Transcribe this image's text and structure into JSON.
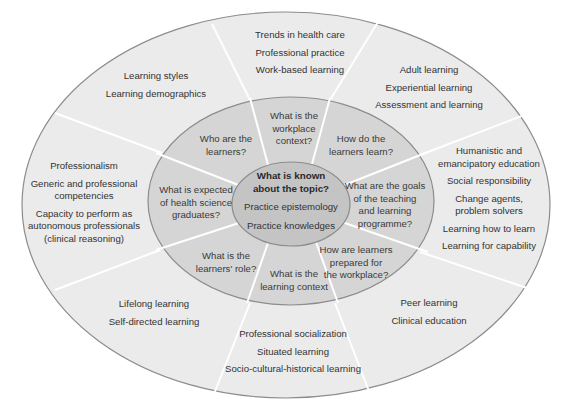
{
  "colors": {
    "outer_ring": "#ebebeb",
    "middle_ring": "#d5d5d5",
    "center": "#c4c4c4",
    "outline": "#8c8c8c",
    "divider": "#ffffff"
  },
  "center": {
    "title_line1": "What is known",
    "title_line2": "about the topic?",
    "items": [
      "Practice epistemology",
      "Practice knowledges"
    ]
  },
  "middle_ring": [
    {
      "id": "who",
      "lines": [
        "Who are the",
        "learners?"
      ]
    },
    {
      "id": "workplace",
      "lines": [
        "What is the",
        "workplace",
        "context?"
      ]
    },
    {
      "id": "how",
      "lines": [
        "How do the",
        "learners learn?"
      ]
    },
    {
      "id": "goals",
      "lines": [
        "What are the goals",
        "of the teaching",
        "and learning",
        "programme?"
      ]
    },
    {
      "id": "prepared",
      "lines": [
        "How are learners",
        "prepared for",
        "the workplace?"
      ]
    },
    {
      "id": "context",
      "lines": [
        "What is the",
        "learning context"
      ]
    },
    {
      "id": "role",
      "lines": [
        "What is the",
        "learners' role?"
      ]
    },
    {
      "id": "expected",
      "lines": [
        "What is expected",
        "of health science",
        "graduates?"
      ]
    }
  ],
  "outer_ring": [
    {
      "id": "learners",
      "items": [
        "Learning styles",
        "Learning demographics"
      ]
    },
    {
      "id": "workplace",
      "items": [
        "Trends in health care",
        "Professional practice",
        "Work-based learning"
      ]
    },
    {
      "id": "how",
      "items": [
        "Adult learning",
        "Experiential learning",
        "Assessment and learning"
      ]
    },
    {
      "id": "goals",
      "items": [
        "Humanistic and",
        "emancipatory education",
        "Social responsibility",
        "Change agents,",
        "problem solvers",
        "Learning how to learn",
        "Learning for capability"
      ]
    },
    {
      "id": "prepared",
      "items": [
        "Peer learning",
        "Clinical education"
      ]
    },
    {
      "id": "context",
      "items": [
        "Professional socialization",
        "Situated learning",
        "Socio-cultural-historical learning"
      ]
    },
    {
      "id": "role",
      "items": [
        "Lifelong learning",
        "Self-directed learning"
      ]
    },
    {
      "id": "expected",
      "items": [
        "Professionalism",
        "Generic and professional",
        "competencies",
        "Capacity to perform as",
        "autonomous professionals",
        "(clinical reasoning)"
      ]
    }
  ]
}
